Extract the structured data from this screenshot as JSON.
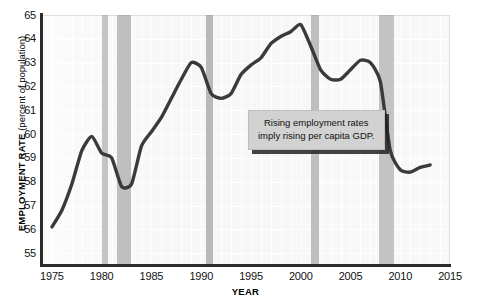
{
  "chart_data": {
    "type": "line",
    "title": "",
    "xlabel": "YEAR",
    "ylabel": "EMPLOYMENT RATE (percent of population)",
    "ylabel_bold": "EMPLOYMENT RATE",
    "ylabel_normal": " (percent of population)",
    "xlim": [
      1974,
      2015
    ],
    "ylim": [
      54.5,
      65
    ],
    "yticks": [
      65,
      64,
      63,
      62,
      61,
      60,
      59,
      58,
      57,
      56,
      55
    ],
    "xticks": [
      1975,
      1980,
      1985,
      1990,
      1995,
      2000,
      2005,
      2010,
      2015
    ],
    "grid": true,
    "legend": "none",
    "line_color": "#3a3a3a",
    "band_color": "#b8b8b8",
    "plot_bg_color": "#f7f7f7",
    "annotations": [
      {
        "name": "rising-employment-callout",
        "line1": "Rising employment rates",
        "line2": "imply rising per capita GDP."
      }
    ],
    "recession_bands": [
      {
        "name": "recession-1980",
        "start": 1980.0,
        "end": 1980.6
      },
      {
        "name": "recession-1981-1982",
        "start": 1981.5,
        "end": 1982.9
      },
      {
        "name": "recession-1990-1991",
        "start": 1990.5,
        "end": 1991.2
      },
      {
        "name": "recession-2001",
        "start": 2001.0,
        "end": 2001.8
      },
      {
        "name": "recession-2008-2009",
        "start": 2007.9,
        "end": 2009.4
      }
    ],
    "x": [
      1975,
      1976,
      1977,
      1978,
      1979,
      1980,
      1981,
      1982,
      1983,
      1984,
      1985,
      1986,
      1987,
      1988,
      1989,
      1990,
      1991,
      1992,
      1993,
      1994,
      1995,
      1996,
      1997,
      1998,
      1999,
      2000,
      2001,
      2002,
      2003,
      2004,
      2005,
      2006,
      2007,
      2008,
      2009,
      2010,
      2011,
      2012,
      2013
    ],
    "values": [
      56.1,
      56.8,
      57.9,
      59.3,
      59.9,
      59.2,
      59.0,
      57.8,
      57.9,
      59.5,
      60.1,
      60.7,
      61.5,
      62.3,
      63.0,
      62.8,
      61.7,
      61.5,
      61.7,
      62.5,
      62.9,
      63.2,
      63.8,
      64.1,
      64.3,
      64.6,
      63.7,
      62.7,
      62.3,
      62.3,
      62.7,
      63.1,
      63.0,
      62.2,
      59.3,
      58.5,
      58.4,
      58.6,
      58.7
    ],
    "value_range_note": ""
  }
}
